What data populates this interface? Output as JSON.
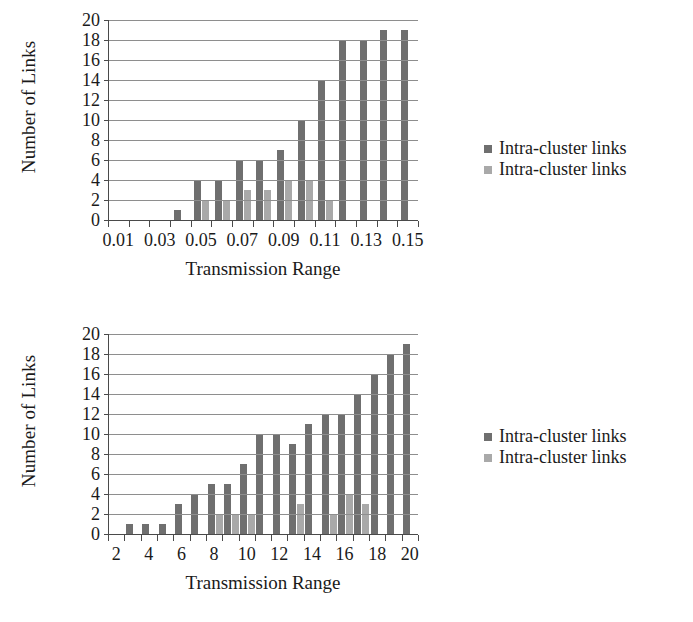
{
  "chart_data": [
    {
      "type": "bar",
      "title": "",
      "xlabel": "Transmission Range",
      "ylabel": "Number of Links",
      "ylim": [
        0,
        20
      ],
      "ytick_step": 2,
      "yticks": [
        0,
        2,
        4,
        6,
        8,
        10,
        12,
        14,
        16,
        18,
        20
      ],
      "grid": true,
      "legend_position": "right",
      "x": [
        0.01,
        0.02,
        0.03,
        0.04,
        0.05,
        0.06,
        0.07,
        0.08,
        0.09,
        0.1,
        0.11,
        0.12,
        0.13,
        0.14,
        0.15
      ],
      "categories": [
        "0.01",
        "0.02",
        "0.03",
        "0.04",
        "0.05",
        "0.06",
        "0.07",
        "0.08",
        "0.09",
        "0.10",
        "0.11",
        "0.12",
        "0.13",
        "0.14",
        "0.15"
      ],
      "xtick_labels": [
        "0.01",
        "0.03",
        "0.05",
        "0.07",
        "0.09",
        "0.11",
        "0.13",
        "0.15"
      ],
      "xtick_values": [
        0.01,
        0.03,
        0.05,
        0.07,
        0.09,
        0.11,
        0.13,
        0.15
      ],
      "series": [
        {
          "name": "Intra-cluster links",
          "color": "#6f6f6f",
          "values": [
            0,
            0,
            0,
            1,
            4,
            4,
            6,
            6,
            7,
            10,
            14,
            18,
            18,
            19,
            19
          ]
        },
        {
          "name": "Intra-cluster links",
          "color": "#a9a9a9",
          "values": [
            0,
            0,
            0,
            0,
            2,
            2,
            3,
            3,
            4,
            4,
            2,
            0,
            0,
            0,
            0
          ]
        }
      ]
    },
    {
      "type": "bar",
      "title": "",
      "xlabel": "Transmission Range",
      "ylabel": "Number of Links",
      "ylim": [
        0,
        20
      ],
      "ytick_step": 2,
      "yticks": [
        0,
        2,
        4,
        6,
        8,
        10,
        12,
        14,
        16,
        18,
        20
      ],
      "grid": true,
      "legend_position": "right",
      "x": [
        2,
        3,
        4,
        5,
        6,
        7,
        8,
        9,
        10,
        11,
        12,
        13,
        14,
        15,
        16,
        17,
        18,
        19,
        20
      ],
      "categories": [
        "2",
        "3",
        "4",
        "5",
        "6",
        "7",
        "8",
        "9",
        "10",
        "11",
        "12",
        "13",
        "14",
        "15",
        "16",
        "17",
        "18",
        "19",
        "20"
      ],
      "xtick_labels": [
        "2",
        "4",
        "6",
        "8",
        "10",
        "12",
        "14",
        "16",
        "18",
        "20"
      ],
      "xtick_values": [
        2,
        4,
        6,
        8,
        10,
        12,
        14,
        16,
        18,
        20
      ],
      "series": [
        {
          "name": "Intra-cluster links",
          "color": "#6f6f6f",
          "values": [
            0,
            1,
            1,
            1,
            3,
            4,
            5,
            5,
            7,
            10,
            10,
            9,
            11,
            12,
            12,
            14,
            16,
            18,
            19
          ]
        },
        {
          "name": "Intra-cluster links",
          "color": "#a9a9a9",
          "values": [
            0,
            0,
            0,
            0,
            0,
            0,
            2,
            2,
            2,
            0,
            0,
            3,
            0,
            2,
            4,
            3,
            0,
            0,
            0
          ]
        }
      ]
    }
  ],
  "figures": [
    {
      "ylabel": "Number of Links",
      "xlabel": "Transmission Range",
      "legend": [
        {
          "label": "Intra-cluster links",
          "color": "#6f6f6f"
        },
        {
          "label": "Intra-cluster links",
          "color": "#a9a9a9"
        }
      ]
    },
    {
      "ylabel": "Number of Links",
      "xlabel": "Transmission Range",
      "legend": [
        {
          "label": "Intra-cluster links",
          "color": "#6f6f6f"
        },
        {
          "label": "Intra-cluster links",
          "color": "#a9a9a9"
        }
      ]
    }
  ]
}
